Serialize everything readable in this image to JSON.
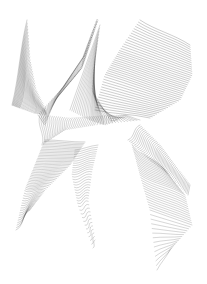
{
  "canvas": {
    "width": 207,
    "height": 284,
    "background": "#ffffff"
  },
  "artwork": {
    "subject": "abstract generative line art of interwoven ruled surfaces",
    "stroke_color": "#1a1a1a",
    "families": [
      {
        "name": "left-triangle-fan",
        "lines": 40,
        "opacity": 0.55,
        "width": 0.35,
        "a": [
          [
            27,
            20
          ],
          [
            30,
            60
          ],
          [
            36,
            90
          ],
          [
            46,
            110
          ]
        ],
        "b": [
          [
            12,
            105
          ],
          [
            20,
            108
          ],
          [
            34,
            113
          ],
          [
            46,
            115
          ]
        ]
      },
      {
        "name": "central-dark-ribbon",
        "lines": 55,
        "opacity": 0.6,
        "width": 0.35,
        "a": [
          [
            98,
            20
          ],
          [
            85,
            55
          ],
          [
            65,
            85
          ],
          [
            38,
            115
          ]
        ],
        "b": [
          [
            96,
            22
          ],
          [
            80,
            70
          ],
          [
            55,
            100
          ],
          [
            45,
            125
          ]
        ]
      },
      {
        "name": "central-crossing-web",
        "lines": 45,
        "opacity": 0.5,
        "width": 0.35,
        "a": [
          [
            40,
            115
          ],
          [
            70,
            118
          ],
          [
            100,
            116
          ],
          [
            125,
            115
          ]
        ],
        "b": [
          [
            42,
            145
          ],
          [
            65,
            130
          ],
          [
            95,
            125
          ],
          [
            140,
            120
          ]
        ]
      },
      {
        "name": "right-wave-sheet",
        "lines": 42,
        "opacity": 0.55,
        "width": 0.4,
        "a": [
          [
            140,
            20
          ],
          [
            120,
            50
          ],
          [
            105,
            75
          ],
          [
            95,
            110
          ]
        ],
        "b": [
          [
            190,
            45
          ],
          [
            192,
            75
          ],
          [
            180,
            100
          ],
          [
            150,
            118
          ]
        ]
      },
      {
        "name": "middle-wave-sheet",
        "lines": 35,
        "opacity": 0.5,
        "width": 0.35,
        "a": [
          [
            100,
            25
          ],
          [
            95,
            60
          ],
          [
            92,
            90
          ],
          [
            110,
            120
          ]
        ],
        "b": [
          [
            70,
            110
          ],
          [
            90,
            120
          ],
          [
            105,
            125
          ],
          [
            125,
            118
          ]
        ]
      },
      {
        "name": "lower-left-blade",
        "lines": 50,
        "opacity": 0.55,
        "width": 0.35,
        "a": [
          [
            45,
            140
          ],
          [
            35,
            165
          ],
          [
            25,
            190
          ],
          [
            16,
            230
          ]
        ],
        "b": [
          [
            85,
            142
          ],
          [
            70,
            165
          ],
          [
            45,
            190
          ],
          [
            30,
            210
          ]
        ]
      },
      {
        "name": "lower-middle-wave-tail",
        "lines": 35,
        "opacity": 0.5,
        "width": 0.35,
        "a": [
          [
            75,
            150
          ],
          [
            72,
            175
          ],
          [
            78,
            205
          ],
          [
            93,
            248
          ]
        ],
        "b": [
          [
            98,
            145
          ],
          [
            92,
            170
          ],
          [
            88,
            200
          ],
          [
            95,
            240
          ]
        ]
      },
      {
        "name": "lower-right-ribbon",
        "lines": 45,
        "opacity": 0.55,
        "width": 0.35,
        "a": [
          [
            128,
            140
          ],
          [
            150,
            160
          ],
          [
            170,
            175
          ],
          [
            188,
            195
          ]
        ],
        "b": [
          [
            140,
            125
          ],
          [
            160,
            145
          ],
          [
            175,
            165
          ],
          [
            190,
            185
          ]
        ]
      },
      {
        "name": "lower-right-wave-tail",
        "lines": 40,
        "opacity": 0.5,
        "width": 0.35,
        "a": [
          [
            132,
            145
          ],
          [
            140,
            175
          ],
          [
            150,
            210
          ],
          [
            157,
            270
          ]
        ],
        "b": [
          [
            165,
            170
          ],
          [
            185,
            195
          ],
          [
            192,
            225
          ],
          [
            170,
            250
          ]
        ]
      }
    ]
  }
}
